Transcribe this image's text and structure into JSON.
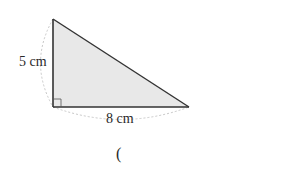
{
  "figure": {
    "type": "right-triangle",
    "height_label": "5 cm",
    "base_label": "8 cm",
    "answer_paren": "(",
    "fill_color": "#e8e8e8",
    "stroke_color": "#333333",
    "arc_color": "#c8c8c8"
  }
}
